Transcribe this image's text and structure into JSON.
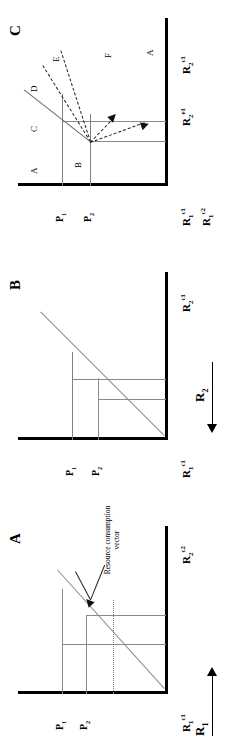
{
  "figure": {
    "global_axes": {
      "x_axis_label": "R2",
      "x_axis_sub": "2",
      "y_axis_label": "R1",
      "y_axis_sub": "1",
      "x_arrow": "arrow-right-icon",
      "y_arrow": "arrow-left-icon"
    },
    "panels": [
      {
        "id": "A",
        "letter": "A",
        "x_axis_tick": "R",
        "x_axis_tick_sub": "2",
        "x_axis_tick_sup": "c2",
        "y_axis_tick": "R",
        "y_axis_tick_sub": "1",
        "y_axis_tick_sup": "c1",
        "iso_labels": [
          "P1",
          "P2"
        ],
        "iso_label_subs": [
          "1",
          "2"
        ],
        "annotation": "Resource consumption vector",
        "annotation_line1": "Resource consumption",
        "annotation_line2": "vector"
      },
      {
        "id": "B",
        "letter": "B",
        "x_axis_tick": "R",
        "x_axis_tick_sub": "2",
        "x_axis_tick_sup": "c1",
        "y_axis_tick": "R",
        "y_axis_tick_sub": "1",
        "y_axis_tick_sup": "c1",
        "iso_labels": [
          "P1",
          "P2"
        ],
        "iso_label_subs": [
          "1",
          "2"
        ]
      },
      {
        "id": "C",
        "letter": "C",
        "x_axis_ticks": [
          {
            "base": "R",
            "sub": "2",
            "sup": "e1"
          },
          {
            "base": "R",
            "sub": "2",
            "sup": "c1"
          }
        ],
        "y_axis_ticks": [
          {
            "base": "R",
            "sub": "1",
            "sup": "c1"
          },
          {
            "base": "R",
            "sub": "1",
            "sup": "c2"
          }
        ],
        "iso_labels": [
          "P1",
          "P2"
        ],
        "iso_label_subs": [
          "1",
          "2"
        ],
        "regions": [
          "A",
          "B",
          "C",
          "D",
          "E",
          "F",
          "A"
        ]
      }
    ]
  },
  "chart_data": {
    "type": "line",
    "xlabel": "R2",
    "ylabel": "R1",
    "panels": [
      {
        "name": "A",
        "description": "Single ZNGI with resource consumption vector",
        "isoclines": [
          {
            "label": "P1",
            "type": "vertical-horizontal-corner"
          },
          {
            "label": "P2",
            "type": "vertical-horizontal-corner"
          }
        ],
        "diagonal": {
          "label": "Resource consumption vector",
          "slope": -1
        }
      },
      {
        "name": "B",
        "description": "Two ZNGIs crossing with consumption vector",
        "isoclines": [
          {
            "label": "P1"
          },
          {
            "label": "P2"
          }
        ],
        "diagonal": {
          "slope": -1
        }
      },
      {
        "name": "C",
        "description": "Competition outcome regions partitioned by consumption vectors",
        "isoclines": [
          {
            "label": "P1"
          },
          {
            "label": "P2"
          }
        ],
        "region_labels": [
          "A",
          "B",
          "C",
          "D",
          "E",
          "F"
        ],
        "dashed_vectors": 2,
        "solid_vectors": 1
      }
    ]
  }
}
